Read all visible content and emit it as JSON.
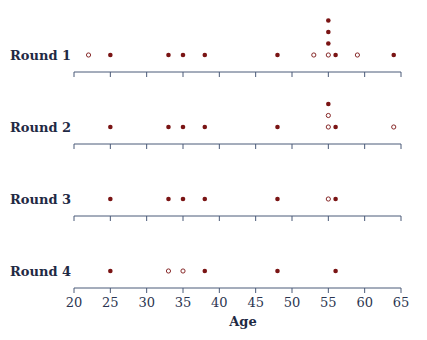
{
  "chart_data": {
    "type": "scatter",
    "subtype": "dot-strip-plot",
    "title": "",
    "xlabel": "Age",
    "ylabel": "",
    "xlim": [
      20,
      65
    ],
    "x_ticks": [
      20,
      25,
      30,
      35,
      40,
      45,
      50,
      55,
      60,
      65
    ],
    "grid": false,
    "legend": null,
    "colors": {
      "dot": "#7a1414",
      "axis": "#4a5a78",
      "label": "#1f2a44"
    },
    "rows": [
      {
        "name": "Round 1",
        "points": [
          {
            "x": 22,
            "filled": false,
            "stack": 0
          },
          {
            "x": 25,
            "filled": true,
            "stack": 0
          },
          {
            "x": 33,
            "filled": true,
            "stack": 0
          },
          {
            "x": 35,
            "filled": true,
            "stack": 0
          },
          {
            "x": 38,
            "filled": true,
            "stack": 0
          },
          {
            "x": 48,
            "filled": true,
            "stack": 0
          },
          {
            "x": 53,
            "filled": false,
            "stack": 0
          },
          {
            "x": 55,
            "filled": false,
            "stack": 0
          },
          {
            "x": 55,
            "filled": true,
            "stack": 1
          },
          {
            "x": 55,
            "filled": true,
            "stack": 2
          },
          {
            "x": 55,
            "filled": true,
            "stack": 3
          },
          {
            "x": 56,
            "filled": true,
            "stack": 0
          },
          {
            "x": 59,
            "filled": false,
            "stack": 0
          },
          {
            "x": 64,
            "filled": true,
            "stack": 0
          }
        ]
      },
      {
        "name": "Round 2",
        "points": [
          {
            "x": 25,
            "filled": true,
            "stack": 0
          },
          {
            "x": 33,
            "filled": true,
            "stack": 0
          },
          {
            "x": 35,
            "filled": true,
            "stack": 0
          },
          {
            "x": 38,
            "filled": true,
            "stack": 0
          },
          {
            "x": 48,
            "filled": true,
            "stack": 0
          },
          {
            "x": 55,
            "filled": false,
            "stack": 0
          },
          {
            "x": 55,
            "filled": false,
            "stack": 1
          },
          {
            "x": 55,
            "filled": true,
            "stack": 2
          },
          {
            "x": 56,
            "filled": true,
            "stack": 0
          },
          {
            "x": 64,
            "filled": false,
            "stack": 0
          }
        ]
      },
      {
        "name": "Round 3",
        "points": [
          {
            "x": 25,
            "filled": true,
            "stack": 0
          },
          {
            "x": 33,
            "filled": true,
            "stack": 0
          },
          {
            "x": 35,
            "filled": true,
            "stack": 0
          },
          {
            "x": 38,
            "filled": true,
            "stack": 0
          },
          {
            "x": 48,
            "filled": true,
            "stack": 0
          },
          {
            "x": 55,
            "filled": false,
            "stack": 0
          },
          {
            "x": 56,
            "filled": true,
            "stack": 0
          }
        ]
      },
      {
        "name": "Round 4",
        "points": [
          {
            "x": 25,
            "filled": true,
            "stack": 0
          },
          {
            "x": 33,
            "filled": false,
            "stack": 0
          },
          {
            "x": 35,
            "filled": false,
            "stack": 0
          },
          {
            "x": 38,
            "filled": true,
            "stack": 0
          },
          {
            "x": 48,
            "filled": true,
            "stack": 0
          },
          {
            "x": 56,
            "filled": true,
            "stack": 0
          }
        ]
      }
    ]
  }
}
